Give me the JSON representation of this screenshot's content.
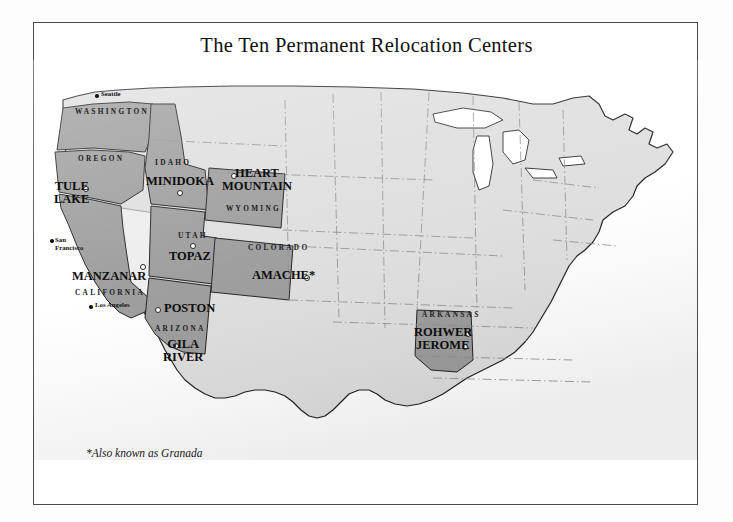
{
  "page": {
    "title": "The Ten Permanent Relocation Centers",
    "footnote": "*Also known as Granada"
  },
  "colors": {
    "camp_state_fill": "#9b9b9b",
    "plain_state_fill": "#dedede",
    "nevada_fill": "#ededed",
    "outline": "#1d1d1d",
    "state_border": "#8a8a8a",
    "frame": "#4a4a4a",
    "lake_fill": "#ffffff",
    "camp_dot_fill": "#ffffff",
    "city_dot_fill": "#111111",
    "text": "#0d0d0d",
    "background": "#ffffff"
  },
  "camps": [
    {
      "name": "TULE LAKE",
      "lines": [
        "TULE",
        "LAKE"
      ],
      "state": "California",
      "label_x": 54,
      "label_y": 185,
      "dot_x": 83,
      "dot_y": 186
    },
    {
      "name": "MANZANAR",
      "lines": [
        "MANZANAR"
      ],
      "state": "California",
      "label_x": 72,
      "label_y": 272,
      "dot_x": 140,
      "dot_y": 264
    },
    {
      "name": "MINIDOKA",
      "lines": [
        "MINIDOKA"
      ],
      "state": "Idaho",
      "label_x": 146,
      "label_y": 176,
      "dot_x": 177,
      "dot_y": 190
    },
    {
      "name": "HEART MOUNTAIN",
      "lines": [
        "HEART",
        "MOUNTAIN"
      ],
      "state": "Wyoming",
      "label_x": 225,
      "label_y": 170,
      "dot_x": 231,
      "dot_y": 173
    },
    {
      "name": "TOPAZ",
      "lines": [
        "TOPAZ"
      ],
      "state": "Utah",
      "label_x": 169,
      "label_y": 252,
      "dot_x": 190,
      "dot_y": 243
    },
    {
      "name": "AMACHE*",
      "lines": [
        "AMACHE*"
      ],
      "state": "Colorado",
      "label_x": 254,
      "label_y": 271,
      "dot_x": 304,
      "dot_y": 275
    },
    {
      "name": "POSTON",
      "lines": [
        "POSTON"
      ],
      "state": "Arizona",
      "label_x": 160,
      "label_y": 304,
      "dot_x": 155,
      "dot_y": 307
    },
    {
      "name": "GILA RIVER",
      "lines": [
        "GILA",
        "RIVER"
      ],
      "state": "Arizona",
      "label_x": 166,
      "label_y": 340,
      "dot_x": 173,
      "dot_y": 343
    },
    {
      "name": "ROHWER",
      "lines": [
        "ROHWER"
      ],
      "state": "Arkansas",
      "label_x": 414,
      "label_y": 328,
      "dot_x": 465,
      "dot_y": 331
    },
    {
      "name": "JEROME",
      "lines": [
        "JEROME"
      ],
      "state": "Arkansas",
      "label_x": 416,
      "label_y": 341,
      "dot_x": 462,
      "dot_y": 344
    }
  ],
  "state_labels": [
    {
      "name": "WASHINGTON",
      "x": 75,
      "y": 107
    },
    {
      "name": "OREGON",
      "x": 78,
      "y": 154
    },
    {
      "name": "IDAHO",
      "x": 155,
      "y": 158
    },
    {
      "name": "WYOMING",
      "x": 226,
      "y": 204
    },
    {
      "name": "UTAH",
      "x": 178,
      "y": 231
    },
    {
      "name": "COLORADO",
      "x": 248,
      "y": 243
    },
    {
      "name": "CALIFORNIA",
      "x": 75,
      "y": 288
    },
    {
      "name": "ARIZONA",
      "x": 155,
      "y": 324
    },
    {
      "name": "ARKANSAS",
      "x": 422,
      "y": 310
    }
  ],
  "cities": [
    {
      "name": "Seattle",
      "lines": [
        "Seattle"
      ],
      "label_x": 101,
      "label_y": 93,
      "dot_x": 95,
      "dot_y": 94
    },
    {
      "name": "San Francisco",
      "lines": [
        "San",
        "Francisco"
      ],
      "label_x": 55,
      "label_y": 238,
      "dot_x": 50,
      "dot_y": 239
    },
    {
      "name": "Los Angeles",
      "lines": [
        "Los Angeles"
      ],
      "label_x": 95,
      "label_y": 303,
      "dot_x": 89,
      "dot_y": 305
    }
  ],
  "map_meta": {
    "camp_state_count": 7,
    "camp_count": 10,
    "projection_note": "contiguous United States"
  }
}
